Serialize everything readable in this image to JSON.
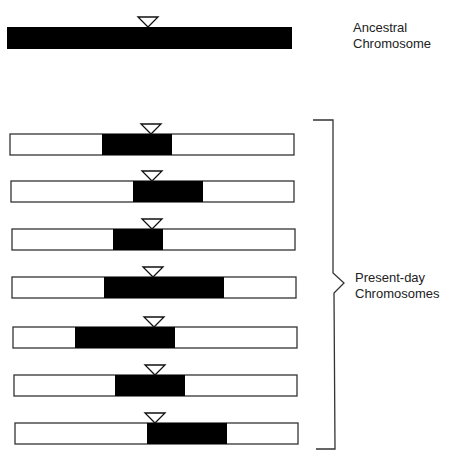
{
  "ancestral": {
    "label_line1": "Ancestral",
    "label_line2": "Chromosome",
    "bar": {
      "x": 7,
      "y": 27,
      "w": 285,
      "h": 22
    },
    "marker_x": 148
  },
  "present_day": {
    "label_line1": "Present-day",
    "label_line2": "Chromosomes",
    "chromosomes": [
      {
        "x": 10,
        "y": 134,
        "w": 284,
        "h": 21,
        "black_start": 102,
        "black_end": 172,
        "marker_x": 151
      },
      {
        "x": 11,
        "y": 181,
        "w": 283,
        "h": 21,
        "black_start": 133,
        "black_end": 203,
        "marker_x": 152
      },
      {
        "x": 12,
        "y": 229,
        "w": 283,
        "h": 21,
        "black_start": 113,
        "black_end": 163,
        "marker_x": 152
      },
      {
        "x": 12,
        "y": 277,
        "w": 284,
        "h": 21,
        "black_start": 104,
        "black_end": 224,
        "marker_x": 153
      },
      {
        "x": 13,
        "y": 327,
        "w": 284,
        "h": 21,
        "black_start": 75,
        "black_end": 175,
        "marker_x": 154
      },
      {
        "x": 14,
        "y": 375,
        "w": 283,
        "h": 21,
        "black_start": 115,
        "black_end": 185,
        "marker_x": 155
      },
      {
        "x": 15,
        "y": 423,
        "w": 283,
        "h": 21,
        "black_start": 147,
        "black_end": 227,
        "marker_x": 155
      }
    ]
  },
  "colors": {
    "segment": "#000000",
    "outline": "#333333",
    "fill": "#ffffff",
    "text": "#222222"
  }
}
